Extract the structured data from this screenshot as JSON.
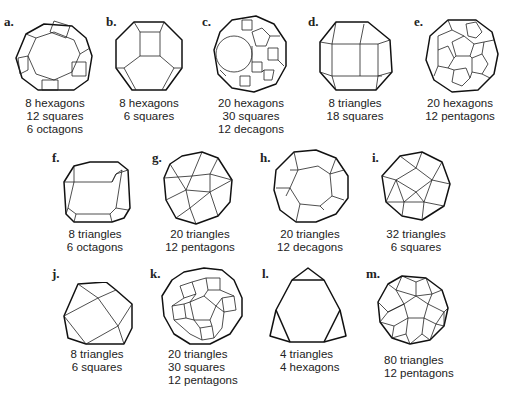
{
  "figure": {
    "panels": [
      {
        "id": "a",
        "letter": "a.",
        "lines": [
          "8 hexagons",
          "12 squares",
          "6 octagons"
        ]
      },
      {
        "id": "b",
        "letter": "b.",
        "lines": [
          "8 hexagons",
          "6 squares"
        ]
      },
      {
        "id": "c",
        "letter": "c.",
        "lines": [
          "20 hexagons",
          "30 squares",
          "12 decagons"
        ]
      },
      {
        "id": "d",
        "letter": "d.",
        "lines": [
          "8 triangles",
          "18 squares"
        ]
      },
      {
        "id": "e",
        "letter": "e.",
        "lines": [
          "20 hexagons",
          "12 pentagons"
        ]
      },
      {
        "id": "f",
        "letter": "f.",
        "lines": [
          "8 triangles",
          "6 octagons"
        ]
      },
      {
        "id": "g",
        "letter": "g.",
        "lines": [
          "20 triangles",
          "12 pentagons"
        ]
      },
      {
        "id": "h",
        "letter": "h.",
        "lines": [
          "20 triangles",
          "12 decagons"
        ]
      },
      {
        "id": "i",
        "letter": "i.",
        "lines": [
          "32 triangles",
          "6 squares"
        ]
      },
      {
        "id": "j",
        "letter": "j.",
        "lines": [
          "8 triangles",
          "6 squares"
        ]
      },
      {
        "id": "k",
        "letter": "k.",
        "lines": [
          "20 triangles",
          "30 squares",
          "12 pentagons"
        ]
      },
      {
        "id": "l",
        "letter": "l.",
        "lines": [
          "4 triangles",
          "4 hexagons"
        ]
      },
      {
        "id": "m",
        "letter": "m.",
        "lines": [
          "80 triangles",
          "12 pentagons"
        ]
      }
    ]
  }
}
